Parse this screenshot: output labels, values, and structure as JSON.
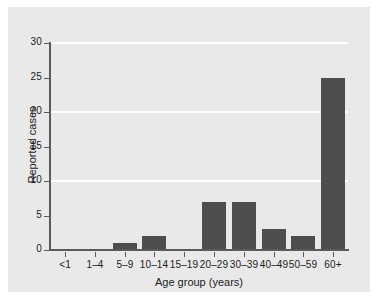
{
  "chart_data": {
    "type": "bar",
    "title": "",
    "xlabel": "Age group (years)",
    "ylabel": "Reported cases",
    "categories": [
      "<1",
      "1–4",
      "5–9",
      "10–14",
      "15–19",
      "20–29",
      "30–39",
      "40–49",
      "50–59",
      "60+"
    ],
    "values": [
      0,
      0,
      1,
      2,
      0,
      7,
      7,
      3,
      2,
      25
    ],
    "ylim": [
      0,
      30
    ],
    "yticks": [
      0,
      5,
      10,
      15,
      20,
      25,
      30
    ],
    "ytick_labels": [
      "0",
      "5",
      "10",
      "15",
      "20",
      "25",
      "30"
    ],
    "gridlines_y": [
      10,
      20,
      30
    ],
    "grid": true,
    "legend": false,
    "bar_color": "#4d4d4d",
    "panel_color": "#e9e9e9",
    "gridline_color": "#ffffff",
    "axis_color": "#5a5a5a"
  }
}
